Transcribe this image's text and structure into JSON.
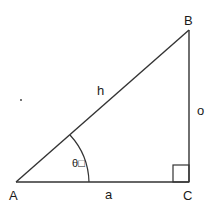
{
  "diagram": {
    "type": "right-triangle",
    "vertices": {
      "A": "A",
      "B": "B",
      "C": "C"
    },
    "sides": {
      "hypotenuse": "h",
      "adjacent": "a",
      "opposite": "o"
    },
    "angle": {
      "symbol": "θ",
      "suffix": "□"
    },
    "stroke_color": "#333333"
  }
}
